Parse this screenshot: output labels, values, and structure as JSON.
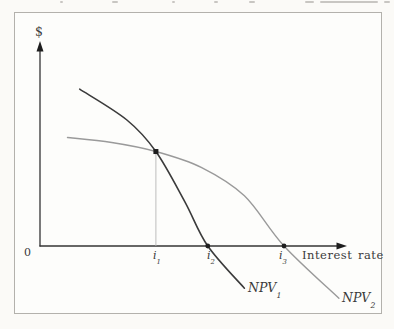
{
  "page": {
    "description_of_top_edge": "illegible cut-off text line from previous page content",
    "top_fragments": [
      {
        "x": 60,
        "w": 3
      },
      {
        "x": 112,
        "w": 6
      },
      {
        "x": 172,
        "w": 3
      },
      {
        "x": 214,
        "w": 4
      },
      {
        "x": 249,
        "w": 6
      },
      {
        "x": 305,
        "w": 9
      },
      {
        "x": 320,
        "w": 58
      },
      {
        "x": 384,
        "w": 6
      }
    ]
  },
  "labels": {
    "dollar": "$",
    "zero": "0",
    "x_axis": "Interest rate",
    "i1": {
      "base": "i",
      "sub": "1"
    },
    "i2": {
      "base": "i",
      "sub": "2"
    },
    "i3": {
      "base": "i",
      "sub": "3"
    },
    "npv1": {
      "base": "NPV",
      "sub": "1"
    },
    "npv2": {
      "base": "NPV",
      "sub": "2"
    }
  },
  "colors": {
    "curve1": "#3b3b3b",
    "curve2": "#9a9a9a",
    "axis": "#343434",
    "guide": "#b5b5b5",
    "marker": "#1e1e1e",
    "frame": "#b3b1ac"
  },
  "chart_data": {
    "type": "line",
    "title": "",
    "xlabel": "Interest rate",
    "ylabel": "$",
    "origin_label": "0",
    "axes_numeric": false,
    "note": "qualitative NPV-vs-interest-rate diagram; coordinates are fractions of axis length (y negative = below x-axis)",
    "x_ticks": [
      {
        "label": "i1",
        "x": 0.38
      },
      {
        "label": "i2",
        "x": 0.55
      },
      {
        "label": "i3",
        "x": 0.8
      }
    ],
    "series": [
      {
        "name": "NPV1",
        "color": "#3b3b3b",
        "width": 1.6,
        "points": [
          [
            0.13,
            0.78
          ],
          [
            0.285,
            0.627
          ],
          [
            0.38,
            0.47
          ],
          [
            0.475,
            0.22
          ],
          [
            0.55,
            0.0
          ],
          [
            0.67,
            -0.21
          ]
        ]
      },
      {
        "name": "NPV2",
        "color": "#9a9a9a",
        "width": 1.4,
        "points": [
          [
            0.09,
            0.54
          ],
          [
            0.235,
            0.515
          ],
          [
            0.38,
            0.47
          ],
          [
            0.53,
            0.39
          ],
          [
            0.67,
            0.25
          ],
          [
            0.8,
            0.0
          ],
          [
            0.98,
            -0.26
          ]
        ]
      }
    ],
    "markers": {
      "intersection": {
        "x": 0.38,
        "y": 0.47,
        "shape": "square"
      },
      "x_intercepts": [
        {
          "x": 0.55
        },
        {
          "x": 0.8
        }
      ]
    },
    "guide_line": {
      "x": 0.38,
      "from_y": 0.47,
      "to_y": 0.0
    },
    "legend_position": "labels-at-curve-ends"
  }
}
